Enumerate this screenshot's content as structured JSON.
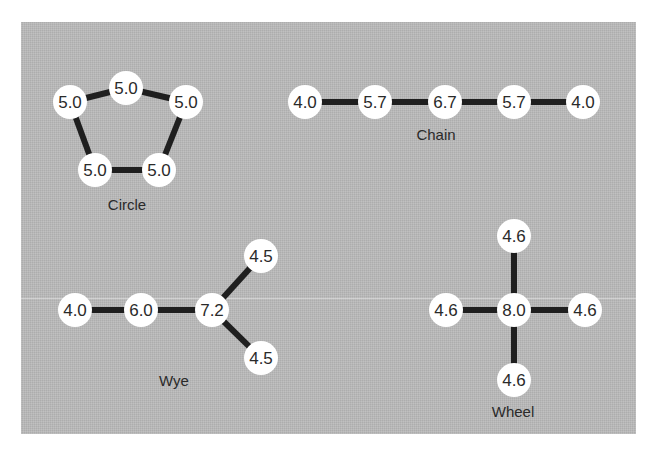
{
  "diagram": {
    "panel_color": "#b9b9b9",
    "edge_color": "#1f1f1f",
    "node_fill": "#ffffff",
    "networks": [
      {
        "name": "Circle",
        "label": "Circle",
        "nodes": [
          {
            "id": "c1",
            "value": "5.0",
            "x": 126,
            "y": 88
          },
          {
            "id": "c2",
            "value": "5.0",
            "x": 186,
            "y": 102
          },
          {
            "id": "c3",
            "value": "5.0",
            "x": 159,
            "y": 170
          },
          {
            "id": "c4",
            "value": "5.0",
            "x": 95,
            "y": 170
          },
          {
            "id": "c5",
            "value": "5.0",
            "x": 70,
            "y": 102
          }
        ],
        "edges": [
          [
            "c1",
            "c2"
          ],
          [
            "c2",
            "c3"
          ],
          [
            "c3",
            "c4"
          ],
          [
            "c4",
            "c5"
          ],
          [
            "c5",
            "c1"
          ]
        ],
        "label_pos": {
          "x": 127,
          "y": 204
        }
      },
      {
        "name": "Chain",
        "label": "Chain",
        "nodes": [
          {
            "id": "h1",
            "value": "4.0",
            "x": 305,
            "y": 102
          },
          {
            "id": "h2",
            "value": "5.7",
            "x": 375,
            "y": 102
          },
          {
            "id": "h3",
            "value": "6.7",
            "x": 445,
            "y": 102
          },
          {
            "id": "h4",
            "value": "5.7",
            "x": 514,
            "y": 102
          },
          {
            "id": "h5",
            "value": "4.0",
            "x": 583,
            "y": 102
          }
        ],
        "edges": [
          [
            "h1",
            "h2"
          ],
          [
            "h2",
            "h3"
          ],
          [
            "h3",
            "h4"
          ],
          [
            "h4",
            "h5"
          ]
        ],
        "label_pos": {
          "x": 436,
          "y": 134
        }
      },
      {
        "name": "Wye",
        "label": "Wye",
        "nodes": [
          {
            "id": "y1",
            "value": "4.0",
            "x": 75,
            "y": 310
          },
          {
            "id": "y2",
            "value": "6.0",
            "x": 141,
            "y": 310
          },
          {
            "id": "y3",
            "value": "7.2",
            "x": 212,
            "y": 310
          },
          {
            "id": "y4",
            "value": "4.5",
            "x": 261,
            "y": 256
          },
          {
            "id": "y5",
            "value": "4.5",
            "x": 261,
            "y": 358
          }
        ],
        "edges": [
          [
            "y1",
            "y2"
          ],
          [
            "y2",
            "y3"
          ],
          [
            "y3",
            "y4"
          ],
          [
            "y3",
            "y5"
          ]
        ],
        "label_pos": {
          "x": 174,
          "y": 380
        }
      },
      {
        "name": "Wheel",
        "label": "Wheel",
        "nodes": [
          {
            "id": "w0",
            "value": "8.0",
            "x": 514,
            "y": 310
          },
          {
            "id": "w1",
            "value": "4.6",
            "x": 514,
            "y": 236
          },
          {
            "id": "w2",
            "value": "4.6",
            "x": 446,
            "y": 310
          },
          {
            "id": "w3",
            "value": "4.6",
            "x": 585,
            "y": 310
          },
          {
            "id": "w4",
            "value": "4.6",
            "x": 514,
            "y": 380
          }
        ],
        "edges": [
          [
            "w0",
            "w1"
          ],
          [
            "w0",
            "w2"
          ],
          [
            "w0",
            "w3"
          ],
          [
            "w0",
            "w4"
          ]
        ],
        "label_pos": {
          "x": 513,
          "y": 411
        }
      }
    ]
  }
}
